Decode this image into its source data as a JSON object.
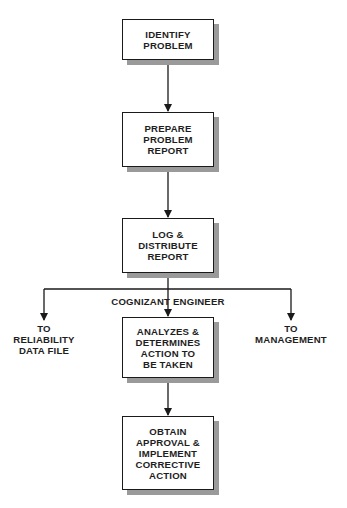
{
  "diagram": {
    "type": "flowchart",
    "colors": {
      "line": "#1a1a1a",
      "shadow": "#9a9a9a",
      "background": "#ffffff"
    },
    "boxes": [
      {
        "id": "identify",
        "lines": [
          "IDENTIFY",
          "PROBLEM"
        ]
      },
      {
        "id": "prepare",
        "lines": [
          "PREPARE",
          "PROBLEM",
          "REPORT"
        ]
      },
      {
        "id": "log",
        "lines": [
          "LOG &",
          "DISTRIBUTE",
          "REPORT"
        ]
      },
      {
        "id": "analyze",
        "lines": [
          "ANALYZES &",
          "DETERMINES",
          "ACTION TO",
          "BE TAKEN"
        ]
      },
      {
        "id": "obtain",
        "lines": [
          "OBTAIN",
          "APPROVAL &",
          "IMPLEMENT",
          "CORRECTIVE",
          "ACTION"
        ]
      }
    ],
    "branch_label": "COGNIZANT ENGINEER",
    "outputs": {
      "left": {
        "lines": [
          "TO",
          "RELIABILITY",
          "DATA FILE"
        ]
      },
      "right": {
        "lines": [
          "TO",
          "MANAGEMENT"
        ]
      }
    },
    "edges": [
      {
        "from": "identify",
        "to": "prepare"
      },
      {
        "from": "prepare",
        "to": "log"
      },
      {
        "from": "log",
        "to": "analyze",
        "label": "COGNIZANT ENGINEER"
      },
      {
        "from": "log",
        "to": "left-output"
      },
      {
        "from": "log",
        "to": "right-output"
      },
      {
        "from": "analyze",
        "to": "obtain"
      }
    ]
  }
}
